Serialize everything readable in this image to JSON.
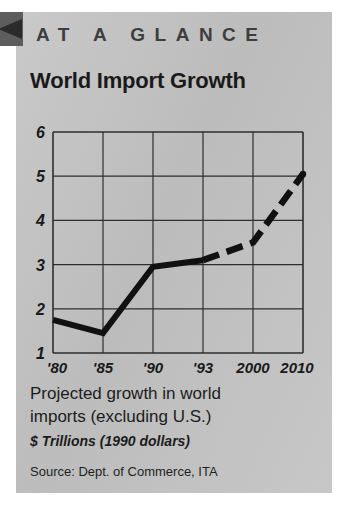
{
  "panel": {
    "kicker": "AT A GLANCE",
    "title": "World Import Growth",
    "caption_line1": "Projected growth in world",
    "caption_line2": "imports (excluding U.S.)",
    "units": "$ Trillions (1990 dollars)",
    "source": "Source: Dept. of Commerce, ITA",
    "background_color": "#c3c3c3",
    "ink_color": "#1a1a1a",
    "corner_mark_color": "#5d5d5d"
  },
  "chart_data": {
    "type": "line",
    "title": "World Import Growth",
    "xlabel": "",
    "ylabel": "$ Trillions (1990 dollars)",
    "categories": [
      "'80",
      "'85",
      "'90",
      "'93",
      "2000",
      "2010"
    ],
    "x_tick_labels": [
      "'80",
      "'85",
      "'90",
      "'93",
      "2000",
      "2010"
    ],
    "y_tick_labels": [
      "6",
      "5",
      "4",
      "3",
      "2",
      "1"
    ],
    "values": [
      1.75,
      1.45,
      2.95,
      3.1,
      3.5,
      5.05
    ],
    "series": [
      {
        "name": "Actual",
        "style": "solid",
        "x": [
          "'80",
          "'85",
          "'90",
          "'93"
        ],
        "values": [
          1.75,
          1.45,
          2.95,
          3.1
        ]
      },
      {
        "name": "Projected",
        "style": "dashed",
        "x": [
          "'93",
          "2000",
          "2010"
        ],
        "values": [
          3.1,
          3.5,
          5.05
        ]
      }
    ],
    "ylim": [
      1,
      6
    ],
    "xlim": [
      0,
      5
    ],
    "grid": true,
    "legend": "none",
    "annotations": [
      "Solid segment = historical; dashed segment = projection"
    ]
  }
}
